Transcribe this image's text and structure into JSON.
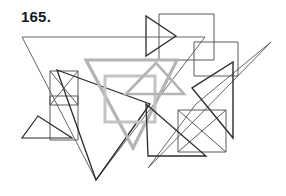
{
  "figure": {
    "label": "165.",
    "type": "overlapping-figures-line-drawing",
    "width": 286,
    "height": 196,
    "background_color": "#ffffff",
    "label_color": "#1a1a1a",
    "stroke_colors": {
      "dark": "#2b2b2b",
      "medium": "#4a4a4a",
      "thin": "#555555",
      "gray": "#b4b4b4",
      "gray_light": "#c4c4c4"
    },
    "shapes": [
      {
        "name": "large-thin-triangle-left",
        "kind": "triangle",
        "color": "#555555",
        "stroke_width": 0.9,
        "points": "22,37 205,37 96,180"
      },
      {
        "name": "large-thin-triangle-right",
        "kind": "triangle",
        "color": "#555555",
        "stroke_width": 0.9,
        "points": "271,42 148,168 196,104"
      },
      {
        "name": "top-right-rectangle-large",
        "kind": "rectangle",
        "color": "#4a4a4a",
        "stroke_width": 0.9,
        "points": "159,14 214,14 214,60 159,60"
      },
      {
        "name": "top-right-rectangle-small",
        "kind": "rectangle",
        "color": "#4a4a4a",
        "stroke_width": 0.9,
        "points": "194,42 238,42 238,76 194,76"
      },
      {
        "name": "arrow-triangle-top",
        "kind": "triangle",
        "color": "#2b2b2b",
        "stroke_width": 1.3,
        "points": "146,16 146,56 176,36"
      },
      {
        "name": "left-square",
        "kind": "square",
        "color": "#4a4a4a",
        "stroke_width": 0.9,
        "points": "50,71 78,71 78,105 50,105"
      },
      {
        "name": "left-lower-rectangle",
        "kind": "rectangle",
        "color": "#4a4a4a",
        "stroke_width": 0.9,
        "points": "50,96 78,96 78,140 50,140"
      },
      {
        "name": "small-left-triangle",
        "kind": "triangle",
        "color": "#2b2b2b",
        "stroke_width": 1.2,
        "points": "38,116 22,138 72,138"
      },
      {
        "name": "dark-zigzag-triangle-lower-left",
        "kind": "triangle",
        "color": "#2b2b2b",
        "stroke_width": 1.3,
        "points": "57,70 96,180 150,104"
      },
      {
        "name": "gray-large-triangle",
        "kind": "triangle",
        "color": "#b4b4b4",
        "stroke_width": 3.2,
        "points": "86,60 177,60 133,148"
      },
      {
        "name": "gray-inner-rectangle",
        "kind": "rectangle",
        "color": "#c4c4c4",
        "stroke_width": 3.0,
        "points": "105,76 155,76 155,122 105,122"
      },
      {
        "name": "gray-small-triangle",
        "kind": "triangle",
        "color": "#b4b4b4",
        "stroke_width": 2.6,
        "points": "156,63 126,94 184,94"
      },
      {
        "name": "dark-bowtie-triangle-right",
        "kind": "triangle",
        "color": "#2b2b2b",
        "stroke_width": 1.4,
        "points": "233,62 233,138 192,88"
      },
      {
        "name": "bottom-right-square",
        "kind": "square",
        "color": "#4a4a4a",
        "stroke_width": 0.9,
        "points": "178,110 226,110 226,152 178,152"
      },
      {
        "name": "dark-long-diagonal-triangle",
        "kind": "triangle",
        "color": "#2b2b2b",
        "stroke_width": 1.3,
        "points": "146,104 206,156 148,156"
      },
      {
        "name": "crossing-diagonal-upper-left",
        "kind": "line",
        "color": "#4a4a4a",
        "stroke_width": 0.9,
        "points": "50,71 78,105"
      },
      {
        "name": "crossing-diagonal-lower-left",
        "kind": "line",
        "color": "#4a4a4a",
        "stroke_width": 0.9,
        "points": "78,71 50,105"
      },
      {
        "name": "crossing-diagonal-right-square-a",
        "kind": "line",
        "color": "#4a4a4a",
        "stroke_width": 0.9,
        "points": "178,110 226,152"
      },
      {
        "name": "crossing-diagonal-right-square-b",
        "kind": "line",
        "color": "#4a4a4a",
        "stroke_width": 0.9,
        "points": "226,110 178,152"
      }
    ]
  }
}
